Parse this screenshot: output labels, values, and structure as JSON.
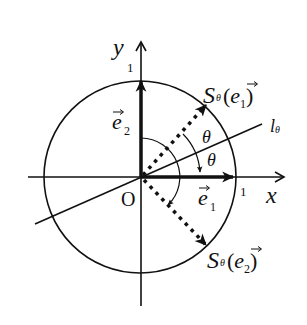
{
  "diagram": {
    "type": "reflection-on-unit-circle",
    "axes": {
      "x_label": "x",
      "y_label": "y",
      "origin_label": "O",
      "x_tick_label": "1",
      "y_tick_label": "1"
    },
    "line": {
      "label": "l",
      "subscript": "θ"
    },
    "vectors": {
      "e1": {
        "base": "e",
        "subscript": "1"
      },
      "e2": {
        "base": "e",
        "subscript": "2"
      },
      "s_e1": {
        "prefix": "S",
        "subscript": "θ",
        "open": "(",
        "base": "e",
        "index": "1",
        "close": ")"
      },
      "s_e2": {
        "prefix": "S",
        "subscript": "θ",
        "open": "(",
        "base": "e",
        "index": "2",
        "close": ")"
      }
    },
    "angles": {
      "upper": "θ",
      "lower": "θ"
    },
    "colors": {
      "ink": "#111111",
      "background": "#ffffff"
    }
  }
}
